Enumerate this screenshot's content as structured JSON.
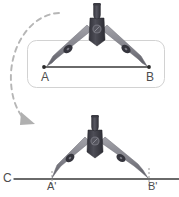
{
  "diagram": {
    "type": "geometric-construction",
    "background_color": "#ffffff",
    "palette": {
      "compass_body": "#8a8a91",
      "compass_body_dark": "#4a4a52",
      "compass_joint": "#3c3c44",
      "compass_handle": "#3f3f47",
      "screw": "#9a9aa2",
      "line": "#3a3a3a",
      "panel_border": "#d0d0d0",
      "arrow": "#b3b3b3",
      "label_text": "#4d4d4d"
    },
    "panel": {
      "name": "segment-panel",
      "x": 27,
      "y": 40,
      "width": 138,
      "height": 48,
      "radius": 9,
      "border_color": "#d0d0d0"
    },
    "top_figure": {
      "name": "compass-over-segment",
      "segment": {
        "label_start": "A",
        "label_end": "B",
        "start_point": [
          44,
          67
        ],
        "end_point": [
          149,
          67
        ],
        "endpoint_marker": "dot"
      },
      "compass": {
        "hinge": [
          97,
          28
        ],
        "handle_top": [
          97,
          4
        ],
        "left_tip": [
          44,
          67
        ],
        "right_tip": [
          149,
          67
        ],
        "span_label": "AB"
      }
    },
    "bottom_figure": {
      "name": "compass-on-line-c",
      "line": {
        "label": "C",
        "start_point": [
          17,
          179
        ],
        "end_point": [
          179,
          179
        ]
      },
      "marks": {
        "label_start": "A'",
        "label_end": "B'",
        "start_point": [
          52,
          179
        ],
        "end_point": [
          149,
          179
        ],
        "tick_style": "dashed"
      },
      "compass": {
        "hinge": [
          95,
          140
        ],
        "handle_top": [
          95,
          116
        ],
        "left_tip": [
          52,
          179
        ],
        "right_tip": [
          149,
          179
        ]
      }
    },
    "arrow": {
      "name": "transfer-arrow",
      "style": "dashed-arc",
      "direction": "counterclockwise-down",
      "color": "#b3b3b3",
      "start_point": [
        59,
        13
      ],
      "end_point": [
        31,
        121
      ]
    },
    "labels": [
      {
        "id": "A",
        "text": "A",
        "x": 41,
        "y": 71,
        "size": 12
      },
      {
        "id": "B",
        "text": "B",
        "x": 146,
        "y": 71,
        "size": 12
      },
      {
        "id": "C",
        "text": "C",
        "x": 3,
        "y": 172,
        "size": 12
      },
      {
        "id": "Ap",
        "text": "A'",
        "x": 47,
        "y": 181,
        "size": 11
      },
      {
        "id": "Bp",
        "text": "B'",
        "x": 148,
        "y": 181,
        "size": 11
      }
    ]
  }
}
